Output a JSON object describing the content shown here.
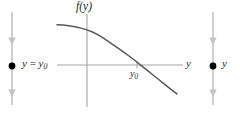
{
  "figure": {
    "kind": "phase-line-and-graph",
    "axes": {
      "vertical_axis_label": "f(y)",
      "horizontal_axis_label": "y",
      "origin_tick_label_base": "y",
      "origin_tick_label_sub": "0"
    },
    "left_phase_line": {
      "equilibrium_label_base": "y",
      "equilibrium_label_op": " = ",
      "equilibrium_label_target": "y",
      "equilibrium_label_sub": "0",
      "arrow_above_direction": "down",
      "arrow_below_direction": "down",
      "dot_label": "equilibrium-point"
    },
    "right_phase_line": {
      "axis_label": "y",
      "arrow_above_direction": "down",
      "arrow_below_direction": "down",
      "dot_label": "equilibrium-point"
    },
    "colors": {
      "curve": "#4d4d4d",
      "axis": "#9a9a9a",
      "phase_line": "#b5b5b5",
      "dot": "#000000",
      "text": "#231f20"
    }
  },
  "chart_data": {
    "type": "line",
    "title": "",
    "xlabel": "y",
    "ylabel": "f(y)",
    "legend": [],
    "grid": false,
    "xlim": [
      -1.6,
      2.6
    ],
    "ylim": [
      -1.35,
      1.35
    ],
    "annotations": [
      {
        "text": "y0",
        "x": 1.0,
        "y": 0.0,
        "role": "root-label"
      },
      {
        "text": "f(y)",
        "x": 0.0,
        "y": 1.35,
        "role": "axis-label"
      },
      {
        "text": "y",
        "x": 2.6,
        "y": 0.0,
        "role": "axis-label"
      }
    ],
    "series": [
      {
        "name": "f(y)",
        "x": [
          -1.6,
          -1.4,
          -1.2,
          -1.0,
          -0.8,
          -0.6,
          -0.4,
          -0.2,
          0.0,
          0.2,
          0.4,
          0.6,
          0.8,
          1.0,
          1.2,
          1.4,
          1.6,
          1.8,
          2.0,
          2.2,
          2.4
        ],
        "values": [
          1.04,
          1.03,
          1.01,
          0.98,
          0.94,
          0.89,
          0.82,
          0.73,
          0.62,
          0.5,
          0.38,
          0.26,
          0.13,
          0.0,
          -0.14,
          -0.28,
          -0.42,
          -0.56,
          -0.7,
          -0.84,
          -0.97
        ]
      }
    ]
  }
}
